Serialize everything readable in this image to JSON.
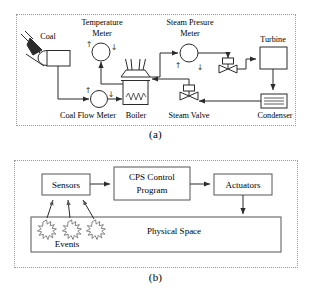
{
  "figure": {
    "panels": [
      {
        "id": "a",
        "caption": "(a)",
        "title": "Coal-fired power plant process diagram",
        "nodes": [
          {
            "key": "coal",
            "label": "Coal",
            "icon": "coal-chute-icon"
          },
          {
            "key": "coal_flow_meter",
            "label": "Coal Flow Meter",
            "icon": "gauge-icon"
          },
          {
            "key": "temperature_meter",
            "label": "Temperature\nMeter",
            "label_line1": "Temperature",
            "label_line2": "Meter",
            "icon": "gauge-icon"
          },
          {
            "key": "boiler",
            "label": "Boiler",
            "icon": "boiler-icon"
          },
          {
            "key": "steam_pressure_meter",
            "label": "Steam Presure\nMeter",
            "label_line1": "Steam Presure",
            "label_line2": "Meter",
            "icon": "gauge-icon"
          },
          {
            "key": "steam_valve",
            "label": "Steam Valve",
            "icon": "control-valve-icon"
          },
          {
            "key": "turbine",
            "label": "Turbine",
            "icon": "rectangle-icon"
          },
          {
            "key": "condenser",
            "label": "Condenser",
            "icon": "condenser-icon"
          }
        ],
        "meter_arrows": {
          "up": "↑",
          "down": "↓"
        }
      },
      {
        "id": "b",
        "caption": "(b)",
        "title": "CPS control loop diagram",
        "nodes": [
          {
            "key": "sensors",
            "label": "Sensors"
          },
          {
            "key": "cps_control",
            "label": "CPS Control\nProgram",
            "label_line1": "CPS Control",
            "label_line2": "Program"
          },
          {
            "key": "actuators",
            "label": "Actuators"
          },
          {
            "key": "physical_space",
            "label": "Physical Space"
          },
          {
            "key": "events",
            "label": "Events"
          }
        ]
      }
    ]
  },
  "colors": {
    "line": "#2b2b2b",
    "frame": "#9a9a9a",
    "box_b": "#555555",
    "event": "#777777",
    "background": "#ffffff"
  }
}
